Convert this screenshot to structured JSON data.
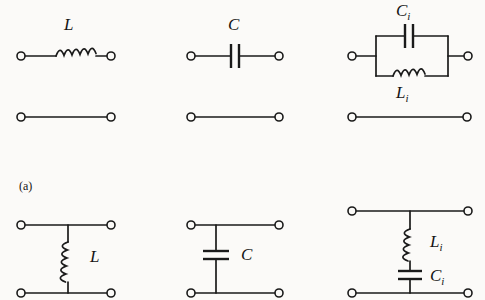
{
  "figure": {
    "caption": "(a)",
    "ink_color": "#1a1a1a",
    "paper_color": "#fbfaf8"
  },
  "series_row": {
    "cells": [
      {
        "id": "series-inductor",
        "label_main": "L",
        "label_sub": "",
        "element": "inductor"
      },
      {
        "id": "series-capacitor",
        "label_main": "C",
        "label_sub": "",
        "element": "capacitor"
      },
      {
        "id": "parallel-tank",
        "label_top_main": "C",
        "label_top_sub": "i",
        "label_bottom_main": "L",
        "label_bottom_sub": "i",
        "element": "parallel-lc"
      }
    ]
  },
  "shunt_row": {
    "cells": [
      {
        "id": "shunt-inductor",
        "label_main": "L",
        "label_sub": "",
        "element": "inductor"
      },
      {
        "id": "shunt-capacitor",
        "label_main": "C",
        "label_sub": "",
        "element": "capacitor"
      },
      {
        "id": "series-lc-branch",
        "label_top_main": "L",
        "label_top_sub": "i",
        "label_bottom_main": "C",
        "label_bottom_sub": "i",
        "element": "series-lc"
      }
    ]
  }
}
